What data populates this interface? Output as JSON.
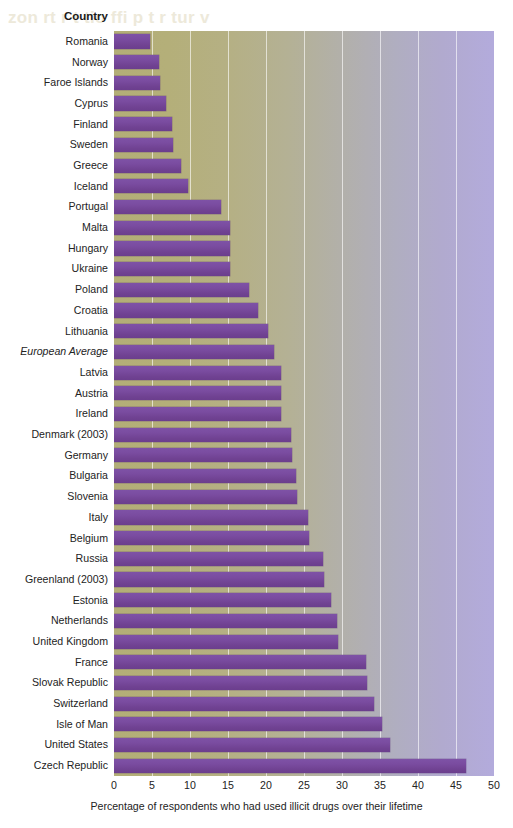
{
  "ghost_text": "zon  rt r  t  tio  ffi   p  t r    tur v  ",
  "header": {
    "category_column_label": "Country"
  },
  "axis": {
    "x_title": "Percentage of respondents who had used illicit drugs over their lifetime",
    "x_ticks": [
      "0",
      "5",
      "10",
      "15",
      "20",
      "25",
      "30",
      "35",
      "40",
      "45",
      "50"
    ]
  },
  "colors": {
    "bar": "#7a4ca0",
    "plot_left": "#b3ae77",
    "plot_right": "#b3abdc",
    "gridline": "#ffffff",
    "text": "#232323"
  },
  "chart_data": {
    "type": "bar",
    "orientation": "horizontal",
    "title": "",
    "xlabel": "Percentage of respondents who had used illicit drugs over their lifetime",
    "ylabel": "Country",
    "xlim": [
      0,
      50
    ],
    "xticks": [
      0,
      5,
      10,
      15,
      20,
      25,
      30,
      35,
      40,
      45,
      50
    ],
    "grid": "vertical",
    "legend": "none",
    "categories": [
      "Romania",
      "Norway",
      "Faroe Islands",
      "Cyprus",
      "Finland",
      "Sweden",
      "Greece",
      "Iceland",
      "Portugal",
      "Malta",
      "Hungary",
      "Ukraine",
      "Poland",
      "Croatia",
      "Lithuania",
      "European Average",
      "Latvia",
      "Austria",
      "Ireland",
      "Denmark (2003)",
      "Germany",
      "Bulgaria",
      "Slovenia",
      "Italy",
      "Belgium",
      "Russia",
      "Greenland (2003)",
      "Estonia",
      "Netherlands",
      "United Kingdom",
      "France",
      "Slovak Republic",
      "Switzerland",
      "Isle of Man",
      "United States",
      "Czech Republic"
    ],
    "values": [
      4.7,
      5.9,
      6.0,
      6.8,
      7.6,
      7.7,
      8.8,
      9.8,
      14.1,
      15.2,
      15.3,
      15.3,
      17.8,
      19.0,
      20.2,
      21.0,
      22.0,
      22.0,
      22.0,
      23.3,
      23.4,
      24.0,
      24.1,
      25.5,
      25.6,
      27.5,
      27.6,
      28.5,
      29.4,
      29.5,
      33.2,
      33.3,
      34.2,
      35.2,
      36.3,
      46.3
    ],
    "italic_categories": [
      "European Average"
    ]
  }
}
